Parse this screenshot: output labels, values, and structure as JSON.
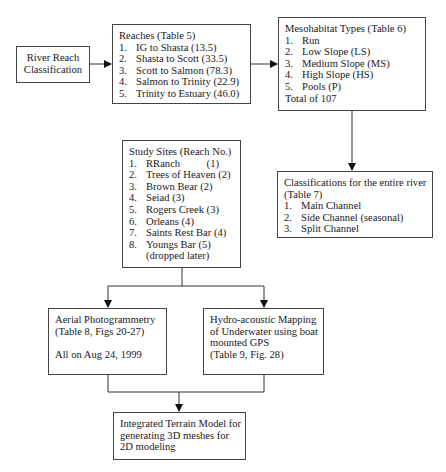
{
  "river_reach": {
    "lines": [
      "River Reach",
      "Classification"
    ]
  },
  "reaches": {
    "title": "Reaches (Table 5)",
    "items": [
      {
        "num": "1.",
        "text": "IG to Shasta (13.5)"
      },
      {
        "num": "2.",
        "text": "Shasta to Scott (33.5)"
      },
      {
        "num": "3.",
        "text": "Scott to Salmon (78.3)"
      },
      {
        "num": "4.",
        "text": "Salmon to Trinity (22.9)"
      },
      {
        "num": "5.",
        "text": "Trinity to Estuary (46.0)"
      }
    ]
  },
  "mesohabitat": {
    "title": "Mesohabitat Types (Table 6)",
    "items": [
      {
        "num": "1.",
        "text": "Run"
      },
      {
        "num": "2.",
        "text": "Low Slope (LS)"
      },
      {
        "num": "3.",
        "text": "Medium Slope (MS)"
      },
      {
        "num": "4.",
        "text": "High Slope (HS)"
      },
      {
        "num": "5.",
        "text": "Pools (P)"
      }
    ],
    "footer": "Total of 107"
  },
  "study_sites": {
    "title": "Study Sites (Reach No.)",
    "items": [
      {
        "num": "1.",
        "text": "RRanch          (1)"
      },
      {
        "num": "2.",
        "text": "Trees of Heaven (2)"
      },
      {
        "num": "3.",
        "text": "Brown Bear (2)"
      },
      {
        "num": "4.",
        "text": "Seiad (3)"
      },
      {
        "num": "5.",
        "text": "Rogers Creek (3)"
      },
      {
        "num": "6.",
        "text": "Orleans (4)"
      },
      {
        "num": "7.",
        "text": "Saints Rest Bar (4)"
      },
      {
        "num": "8.",
        "text": "Youngs Bar (5)"
      }
    ],
    "note": "(dropped later)"
  },
  "classifications": {
    "title_lines": [
      "Classifications for the entire river",
      "(Table 7)"
    ],
    "items": [
      {
        "num": "1.",
        "text": "Main Channel"
      },
      {
        "num": "2.",
        "text": "Side Channel (seasonal)"
      },
      {
        "num": "3.",
        "text": "Split Channel"
      }
    ]
  },
  "aerial": {
    "lines": [
      "Aerial Photogrammetry",
      "(Table 8, Figs 20-27)",
      "",
      "All on Aug 24, 1999"
    ]
  },
  "hydro": {
    "lines": [
      "Hydro-acoustic Mapping",
      "of Underwater using boat",
      "mounted GPS",
      "(Table 9, Fig. 28)"
    ]
  },
  "terrain": {
    "lines": [
      "Integrated Terrain Model for",
      "generating 3D meshes for",
      "2D modeling"
    ]
  },
  "colors": {
    "line": "#333333",
    "border": "#444444",
    "text": "#1a1a1a"
  }
}
